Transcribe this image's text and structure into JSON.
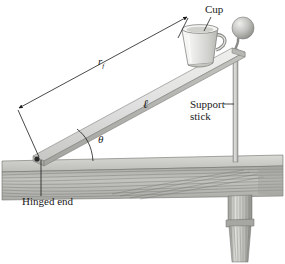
{
  "figure": {
    "background_color": "#ffffff"
  },
  "labels": {
    "cup": "Cup",
    "support_stick_line1": "Support",
    "support_stick_line2": "stick",
    "hinged_end": "Hinged end",
    "radius_symbol": "r",
    "radius_subscript": "f",
    "length_symbol": "ℓ",
    "angle_symbol": "θ"
  },
  "colors": {
    "board_face": "#d8d8d4",
    "board_edge": "#8f8f8c",
    "table_wood": "#b4b4b0",
    "stick": "#c9c9c6",
    "cup_body": "#e6e6e4",
    "knob": "#b0b0ad",
    "line": "#1a1a1a"
  },
  "annotations": {
    "dimension_line": "r_f dimension arrow spanning board from hinge to cup end",
    "angle_arc": "theta between board and table surface",
    "leader_cup": "leader line from Cup label to mug",
    "leader_support": "leader dash from Support stick label to stick",
    "leader_hinged": "vertical leader from Hinged end label to pivot"
  }
}
